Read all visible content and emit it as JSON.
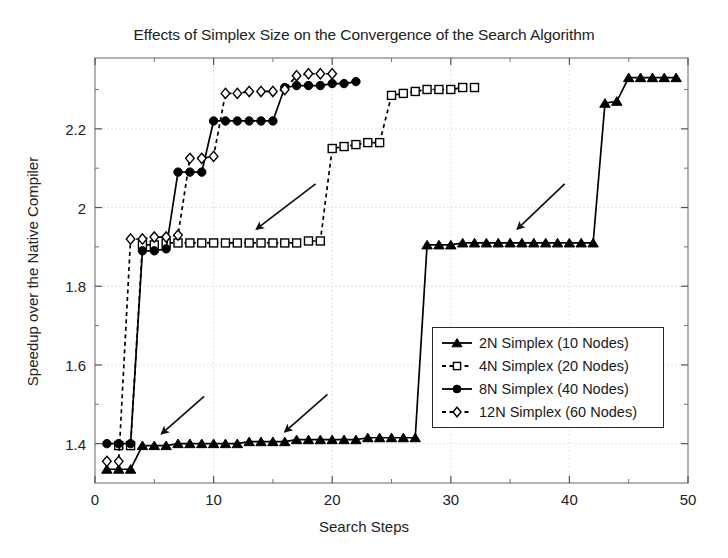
{
  "chart_data": {
    "type": "line",
    "title": "Effects of Simplex Size on the Convergence of the Search Algorithm",
    "xlabel": "Search Steps",
    "ylabel": "Speedup over the Native Compiler",
    "xlim": [
      0,
      50
    ],
    "ylim": [
      1.3,
      2.38
    ],
    "xticks": [
      0,
      10,
      20,
      30,
      40,
      50
    ],
    "yticks": [
      1.4,
      1.6,
      1.8,
      2,
      2.2
    ],
    "ytick_labels": [
      "1.4",
      "1.6",
      "1.8",
      "2",
      "2.2"
    ],
    "xtick_labels": [
      "0",
      "10",
      "20",
      "30",
      "40",
      "50"
    ],
    "grid": true,
    "legend_position": "lower right",
    "series": [
      {
        "name": "2N Simplex (10 Nodes)",
        "marker": "triangle-filled",
        "line": "solid",
        "color": "#000000",
        "x": [
          1,
          2,
          3,
          4,
          5,
          6,
          7,
          8,
          9,
          10,
          11,
          12,
          13,
          14,
          15,
          16,
          17,
          18,
          19,
          20,
          21,
          22,
          23,
          24,
          25,
          26,
          27,
          28,
          29,
          30,
          31,
          32,
          33,
          34,
          35,
          36,
          37,
          38,
          39,
          40,
          41,
          42,
          43,
          44,
          45,
          46,
          47,
          48,
          49
        ],
        "y": [
          1.335,
          1.335,
          1.335,
          1.395,
          1.395,
          1.395,
          1.4,
          1.4,
          1.4,
          1.4,
          1.4,
          1.4,
          1.405,
          1.405,
          1.405,
          1.405,
          1.41,
          1.41,
          1.41,
          1.41,
          1.41,
          1.41,
          1.415,
          1.415,
          1.415,
          1.415,
          1.415,
          1.905,
          1.905,
          1.905,
          1.91,
          1.91,
          1.91,
          1.91,
          1.91,
          1.91,
          1.91,
          1.91,
          1.91,
          1.91,
          1.91,
          1.91,
          2.265,
          2.27,
          2.33,
          2.33,
          2.33,
          2.33,
          2.33
        ]
      },
      {
        "name": "4N Simplex (20 Nodes)",
        "marker": "square-open",
        "line": "dashed",
        "color": "#000000",
        "x": [
          2,
          3,
          4,
          5,
          6,
          7,
          8,
          9,
          10,
          11,
          12,
          13,
          14,
          15,
          16,
          17,
          18,
          19,
          20,
          21,
          22,
          23,
          24,
          25,
          26,
          27,
          28,
          29,
          30,
          31,
          32
        ],
        "y": [
          1.395,
          1.395,
          1.905,
          1.905,
          1.91,
          1.91,
          1.91,
          1.91,
          1.91,
          1.91,
          1.91,
          1.91,
          1.91,
          1.91,
          1.91,
          1.91,
          1.915,
          1.915,
          2.15,
          2.155,
          2.16,
          2.165,
          2.165,
          2.285,
          2.29,
          2.295,
          2.3,
          2.3,
          2.3,
          2.305,
          2.305
        ]
      },
      {
        "name": "8N Simplex (40 Nodes)",
        "marker": "circle-filled",
        "line": "solid",
        "color": "#000000",
        "x": [
          1,
          2,
          3,
          4,
          5,
          6,
          7,
          8,
          9,
          10,
          11,
          12,
          13,
          14,
          15,
          16,
          17,
          18,
          19,
          20,
          21,
          22
        ],
        "y": [
          1.4,
          1.4,
          1.4,
          1.89,
          1.89,
          1.895,
          2.09,
          2.09,
          2.09,
          2.22,
          2.22,
          2.22,
          2.22,
          2.22,
          2.22,
          2.305,
          2.31,
          2.31,
          2.31,
          2.315,
          2.315,
          2.32
        ]
      },
      {
        "name": "12N Simplex (60 Nodes)",
        "marker": "diamond-open",
        "line": "dashed",
        "color": "#000000",
        "x": [
          1,
          2,
          3,
          4,
          5,
          6,
          7,
          8,
          9,
          10,
          11,
          12,
          13,
          14,
          15,
          16,
          17,
          18,
          19,
          20
        ],
        "y": [
          1.355,
          1.355,
          1.92,
          1.92,
          1.925,
          1.925,
          1.93,
          2.125,
          2.125,
          2.13,
          2.29,
          2.29,
          2.295,
          2.295,
          2.295,
          2.3,
          2.335,
          2.34,
          2.34,
          2.34
        ]
      }
    ],
    "annotations": [
      {
        "name": "arrow-4n-plateau",
        "x1": 18.6,
        "y1": 2.06,
        "x2": 13.6,
        "y2": 1.945
      },
      {
        "name": "arrow-2n-low-left",
        "x1": 9.2,
        "y1": 1.52,
        "x2": 5.6,
        "y2": 1.425
      },
      {
        "name": "arrow-2n-low-right",
        "x1": 19.6,
        "y1": 1.525,
        "x2": 16.0,
        "y2": 1.43
      },
      {
        "name": "arrow-2n-right-plateau",
        "x1": 39.6,
        "y1": 2.06,
        "x2": 35.6,
        "y2": 1.945
      }
    ]
  },
  "legend": {
    "items": [
      {
        "label": "2N Simplex (10 Nodes)",
        "marker": "triangle-filled",
        "line": "solid"
      },
      {
        "label": "4N Simplex (20 Nodes)",
        "marker": "square-open",
        "line": "dashed"
      },
      {
        "label": "8N Simplex (40 Nodes)",
        "marker": "circle-filled",
        "line": "solid"
      },
      {
        "label": "12N Simplex (60 Nodes)",
        "marker": "diamond-open",
        "line": "dashed"
      }
    ]
  }
}
